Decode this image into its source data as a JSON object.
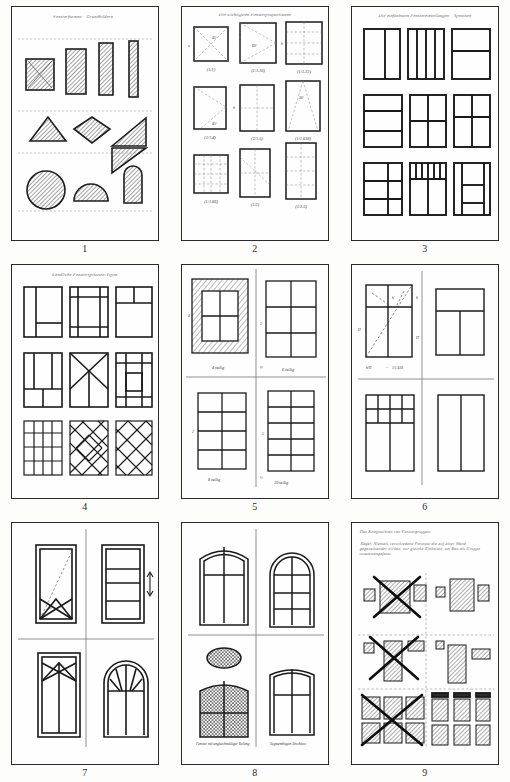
{
  "document": {
    "kind": "scanned-sketch-sheet",
    "page_width": 510,
    "page_height": 782,
    "background_color": "#fdfdfc",
    "ink_color": "#2b2b2b",
    "plate_count": 9
  },
  "plates": [
    {
      "number": "1",
      "heading": "Fensterformen – Grundbildern –",
      "topic": "basic window shapes",
      "rows": [
        {
          "label": "rectangular formats",
          "shapes": [
            "square",
            "vertical-rectangle",
            "narrow-vertical-rectangle",
            "slit-rectangle"
          ]
        },
        {
          "label": "angular formats",
          "shapes": [
            "triangle",
            "diamond",
            "right-triangle-pair"
          ]
        },
        {
          "label": "curved formats",
          "shapes": [
            "circle",
            "semicircle",
            "round-arch"
          ]
        }
      ]
    },
    {
      "number": "2",
      "heading": "Die wichtigsten Fensterproportionen",
      "topic": "window proportion ratios",
      "ratios": [
        "(1/1)",
        "(1/1.16)",
        "(1/1.33)",
        "(1/1.4)",
        "(1/1.5)",
        "(1/1.618)",
        "(1/1.66)",
        "(1/2)",
        "(1/2.5)"
      ],
      "angles": [
        "45°",
        "60°",
        "36°"
      ],
      "side_marks": [
        "a",
        "b",
        "h",
        "H"
      ]
    },
    {
      "number": "3",
      "heading": "Die einfachsten Fenstereinteilungen – Sprossen",
      "topic": "simple sash divisions",
      "variants": [
        "two vertical lights",
        "four narrow vertical lights",
        "horizontal transom, two lights",
        "three horizontal bands",
        "four-pane cross division",
        "six-pane division",
        "six-pane with side light",
        "upper small lights row",
        "stacked horizontal panes"
      ]
    },
    {
      "number": "4",
      "heading": "Ländliche Fenstersprossen-Typen",
      "topic": "rural glazing bar patterns",
      "variants": [
        "side light with low transom",
        "double cross bars",
        "small corner light",
        "tall side lights over base",
        "radiating star bars",
        "border grid with centre panel",
        "regular square grid",
        "diamond lattice with centre lozenge",
        "full diamond lattice"
      ]
    },
    {
      "number": "5",
      "heading": "Fensterflügel-Teilungen",
      "topic": "number of lights per casement",
      "captions": [
        "4 teilig",
        "6 teilig",
        "8 teilig",
        "10 teilig"
      ],
      "sub_marks": [
        "1",
        "2",
        "3",
        "4",
        "5",
        "½",
        "¼"
      ]
    },
    {
      "number": "6",
      "heading": "Fenster mit Oberlicht",
      "topic": "windows with transom lights",
      "marks": [
        "H",
        "h",
        "H'",
        "h'"
      ],
      "formula": "h / H = 1 : 1.618",
      "variants": [
        "casement with upper light and diagonal construction",
        "wide transom over two casements",
        "multi-pane upper light over two casements",
        "two-light casement without transom"
      ]
    },
    {
      "number": "7",
      "heading": "Sondertypen",
      "topic": "special window and louvre types",
      "marks": [
        "45°"
      ],
      "variants": [
        "diagonal-braced shutter frame",
        "hinged louvre sash with swing arrow",
        "cross-braced barn window",
        "round-arched fanlight window"
      ]
    },
    {
      "number": "8",
      "heading": "Bogenfenster",
      "topic": "arched windows",
      "captions": [
        "Fensters mit ungleichmäßiger Teilung",
        "Segmentbogen Abschluss"
      ],
      "variants": [
        "segmental-arch four-light window",
        "round-arch six-light window",
        "oval light above leaded casement",
        "segmental-arch cross-division window"
      ]
    },
    {
      "number": "9",
      "heading": "Das Komponieren von Fenstergruppen",
      "rule_text": "Regel: Niemals verschiedene Formate die auf einer Wand gegeneinander wirken, nur gleiche Einheiten, am Bau als Gruppe zusammengefasst.",
      "topic": "composing window groups — right and wrong",
      "columns": [
        "wrong",
        "right"
      ],
      "wrong_marker": "X"
    }
  ]
}
